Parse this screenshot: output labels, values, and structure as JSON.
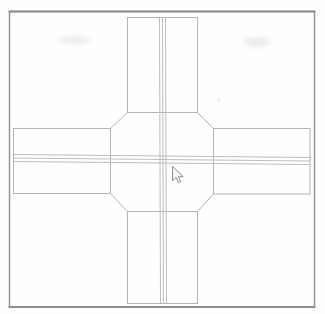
{
  "canvas": {
    "width_px": 325,
    "height_px": 314,
    "background": "#fefefe"
  },
  "colors": {
    "frame": "#979797",
    "frame_edge_dark": "#8e8e8e",
    "road_outline": "#b5b5b5",
    "center_line": "#bdbdbd",
    "cursor_outline": "#8f8f8f",
    "cursor_fill": "#f5f5f5"
  },
  "drawing": {
    "subject": "four-way road intersection wireframe with chamfered junction corners and triple center lines",
    "cursor": "arrow-pointer"
  }
}
